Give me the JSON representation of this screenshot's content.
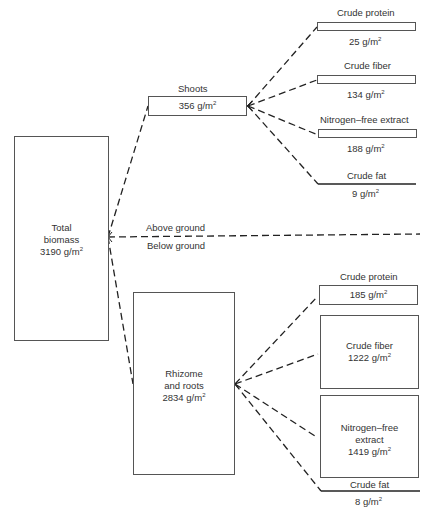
{
  "total": {
    "line1": "Total",
    "line2": "biomass",
    "value": "3190 g/m",
    "sup": "2"
  },
  "divider": {
    "above": "Above ground",
    "below": "Below ground"
  },
  "shoots": {
    "title": "Shoots",
    "value": "356 g/m",
    "sup": "2",
    "components": [
      {
        "label": "Crude protein",
        "value": "25 g/m",
        "sup": "2"
      },
      {
        "label": "Crude fiber",
        "value": "134 g/m",
        "sup": "2"
      },
      {
        "label": "Nitrogen–free extract",
        "value": "188 g/m",
        "sup": "2"
      },
      {
        "label": "Crude fat",
        "value": "9 g/m",
        "sup": "2"
      }
    ]
  },
  "roots": {
    "line1": "Rhizome",
    "line2": "and roots",
    "value": "2834 g/m",
    "sup": "2",
    "components": [
      {
        "label": "Crude protein",
        "value": "185 g/m",
        "sup": "2"
      },
      {
        "label": "Crude fiber",
        "value": "1222 g/m",
        "sup": "2"
      },
      {
        "label1": "Nitrogen–free",
        "label2": "extract",
        "value": "1419 g/m",
        "sup": "2"
      },
      {
        "label": "Crude fat",
        "value": "8 g/m",
        "sup": "2"
      }
    ]
  }
}
